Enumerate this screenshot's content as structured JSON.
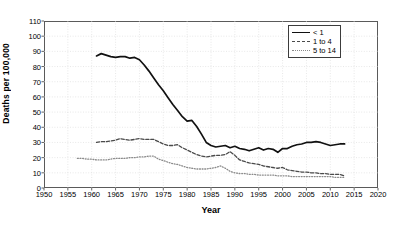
{
  "chart_data": {
    "type": "line",
    "title": "",
    "xlabel": "Year",
    "ylabel": "Deaths per 100,000",
    "xlim": [
      1950,
      2020
    ],
    "ylim": [
      0,
      110
    ],
    "xticks": [
      1950,
      1955,
      1960,
      1965,
      1970,
      1975,
      1980,
      1985,
      1990,
      1995,
      2000,
      2005,
      2010,
      2015,
      2020
    ],
    "yticks": [
      0,
      10,
      20,
      30,
      40,
      50,
      60,
      70,
      80,
      90,
      100,
      110
    ],
    "grid": true,
    "legend_position": "top-right",
    "series": [
      {
        "name": "< 1",
        "style": "solid",
        "color": "#111111",
        "x": [
          1961,
          1962,
          1963,
          1964,
          1965,
          1966,
          1967,
          1968,
          1969,
          1970,
          1971,
          1972,
          1973,
          1974,
          1975,
          1976,
          1977,
          1978,
          1979,
          1980,
          1981,
          1982,
          1983,
          1984,
          1985,
          1986,
          1987,
          1988,
          1989,
          1990,
          1991,
          1992,
          1993,
          1994,
          1995,
          1996,
          1997,
          1998,
          1999,
          2000,
          2001,
          2002,
          2003,
          2004,
          2005,
          2006,
          2007,
          2008,
          2009,
          2010,
          2011,
          2012,
          2013
        ],
        "y": [
          87.0,
          88.5,
          87.5,
          86.5,
          86.0,
          86.5,
          86.5,
          85.5,
          86.0,
          84.5,
          81.0,
          77.0,
          72.5,
          68.0,
          64.0,
          59.5,
          55.0,
          51.0,
          47.0,
          44.0,
          44.5,
          40.5,
          35.5,
          30.0,
          28.0,
          27.0,
          27.5,
          28.0,
          26.5,
          27.5,
          26.0,
          25.5,
          24.5,
          25.5,
          26.5,
          25.0,
          26.0,
          25.5,
          23.5,
          26.0,
          26.0,
          27.5,
          28.5,
          29.0,
          30.0,
          30.0,
          30.5,
          30.0,
          29.0,
          28.0,
          28.5,
          29.0,
          29.0
        ]
      },
      {
        "name": "1 to 4",
        "style": "dashed",
        "color": "#4a4a4a",
        "x": [
          1961,
          1962,
          1963,
          1964,
          1965,
          1966,
          1967,
          1968,
          1969,
          1970,
          1971,
          1972,
          1973,
          1974,
          1975,
          1976,
          1977,
          1978,
          1979,
          1980,
          1981,
          1982,
          1983,
          1984,
          1985,
          1986,
          1987,
          1988,
          1989,
          1990,
          1991,
          1992,
          1993,
          1994,
          1995,
          1996,
          1997,
          1998,
          1999,
          2000,
          2001,
          2002,
          2003,
          2004,
          2005,
          2006,
          2007,
          2008,
          2009,
          2010,
          2011,
          2012,
          2013
        ],
        "y": [
          30.0,
          30.5,
          30.5,
          31.0,
          31.5,
          32.5,
          32.0,
          31.5,
          32.0,
          32.5,
          32.0,
          32.0,
          32.0,
          30.5,
          29.0,
          28.0,
          28.0,
          28.5,
          26.5,
          25.0,
          23.5,
          22.0,
          21.0,
          20.5,
          21.0,
          21.5,
          21.5,
          22.0,
          24.0,
          21.5,
          18.5,
          17.5,
          16.5,
          16.0,
          15.5,
          14.5,
          14.0,
          13.5,
          13.0,
          13.5,
          12.0,
          11.5,
          11.0,
          10.5,
          10.5,
          10.0,
          10.0,
          9.5,
          9.5,
          9.0,
          9.0,
          9.0,
          8.0
        ]
      },
      {
        "name": "5 to 14",
        "style": "dotted",
        "color": "#8a8a8a",
        "x": [
          1957,
          1958,
          1959,
          1960,
          1961,
          1962,
          1963,
          1964,
          1965,
          1966,
          1967,
          1968,
          1969,
          1970,
          1971,
          1972,
          1973,
          1974,
          1975,
          1976,
          1977,
          1978,
          1979,
          1980,
          1981,
          1982,
          1983,
          1984,
          1985,
          1986,
          1987,
          1988,
          1989,
          1990,
          1991,
          1992,
          1993,
          1994,
          1995,
          1996,
          1997,
          1998,
          1999,
          2000,
          2001,
          2002,
          2003,
          2004,
          2005,
          2006,
          2007,
          2008,
          2009,
          2010,
          2011,
          2012,
          2013
        ],
        "y": [
          19.5,
          19.5,
          19.0,
          19.0,
          18.5,
          18.5,
          18.5,
          19.0,
          19.5,
          19.5,
          19.5,
          20.0,
          20.0,
          20.5,
          20.5,
          21.0,
          21.0,
          19.0,
          18.0,
          17.0,
          16.0,
          15.5,
          14.5,
          13.5,
          13.0,
          12.5,
          12.5,
          12.5,
          13.0,
          13.5,
          14.5,
          13.0,
          11.0,
          10.0,
          9.5,
          9.5,
          9.0,
          9.0,
          8.5,
          8.5,
          8.5,
          8.5,
          8.0,
          8.0,
          8.0,
          7.5,
          7.5,
          7.5,
          7.5,
          7.5,
          7.5,
          7.5,
          7.5,
          7.5,
          7.0,
          7.0,
          7.0
        ]
      }
    ],
    "legend": [
      "< 1",
      "1 to 4",
      "5 to 14"
    ]
  }
}
